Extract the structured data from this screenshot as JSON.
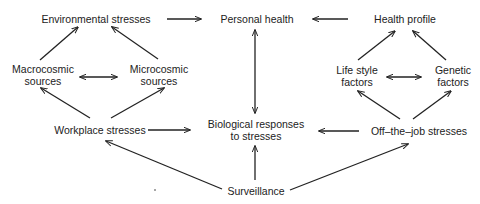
{
  "diagram": {
    "type": "flow-diagram",
    "nodes": {
      "environmental_stresses": {
        "line1": "Environmental stresses"
      },
      "personal_health": {
        "line1": "Personal health"
      },
      "health_profile": {
        "line1": "Health profile"
      },
      "macrocosmic_sources": {
        "line1": "Macrocosmic",
        "line2": "sources"
      },
      "microcosmic_sources": {
        "line1": "Microcosmic",
        "line2": "sources"
      },
      "life_style_factors": {
        "line1": "Life style",
        "line2": "factors"
      },
      "genetic_factors": {
        "line1": "Genetic",
        "line2": "factors"
      },
      "workplace_stresses": {
        "line1": "Workplace stresses"
      },
      "biological_responses": {
        "line1": "Biological responses",
        "line2": "to stresses"
      },
      "off_the_job_stresses": {
        "line1": "Off–the–job stresses"
      },
      "surveillance": {
        "line1": "Surveillance"
      }
    },
    "edges": [
      {
        "from": "Environmental stresses",
        "to": "Personal health",
        "direction": "forward"
      },
      {
        "from": "Health profile",
        "to": "Personal health",
        "direction": "forward"
      },
      {
        "from": "Personal health",
        "to": "Biological responses to stresses",
        "direction": "bidirectional"
      },
      {
        "from": "Macrocosmic sources",
        "to": "Environmental stresses",
        "direction": "forward"
      },
      {
        "from": "Microcosmic sources",
        "to": "Environmental stresses",
        "direction": "forward"
      },
      {
        "from": "Macrocosmic sources",
        "to": "Microcosmic sources",
        "direction": "bidirectional"
      },
      {
        "from": "Workplace stresses",
        "to": "Macrocosmic sources",
        "direction": "forward"
      },
      {
        "from": "Workplace stresses",
        "to": "Microcosmic sources",
        "direction": "forward"
      },
      {
        "from": "Workplace stresses",
        "to": "Biological responses to stresses",
        "direction": "forward"
      },
      {
        "from": "Life style factors",
        "to": "Health profile",
        "direction": "forward"
      },
      {
        "from": "Genetic factors",
        "to": "Health profile",
        "direction": "forward"
      },
      {
        "from": "Life style factors",
        "to": "Genetic factors",
        "direction": "bidirectional"
      },
      {
        "from": "Off-the-job stresses",
        "to": "Life style factors",
        "direction": "forward"
      },
      {
        "from": "Off-the-job stresses",
        "to": "Genetic factors",
        "direction": "forward"
      },
      {
        "from": "Off-the-job stresses",
        "to": "Biological responses to stresses",
        "direction": "forward"
      },
      {
        "from": "Surveillance",
        "to": "Workplace stresses",
        "direction": "forward"
      },
      {
        "from": "Surveillance",
        "to": "Biological responses to stresses",
        "direction": "forward"
      },
      {
        "from": "Surveillance",
        "to": "Off-the-job stresses",
        "direction": "forward"
      }
    ]
  }
}
